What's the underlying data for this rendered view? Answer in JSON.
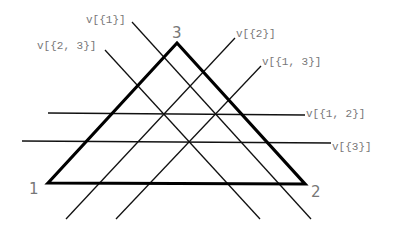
{
  "diagram": {
    "type": "triangle-line-arrangement",
    "colors": {
      "triangle": "#000000",
      "lines": "#111111",
      "labels": "#777777"
    },
    "triangle": {
      "vertices": [
        {
          "id": "1",
          "label": "1"
        },
        {
          "id": "2",
          "label": "2"
        },
        {
          "id": "3",
          "label": "3"
        }
      ]
    },
    "lines": [
      {
        "id": "v1",
        "label": "v[{1}]",
        "direction": "descending-right"
      },
      {
        "id": "v23",
        "label": "v[{2, 3}]",
        "direction": "descending-right"
      },
      {
        "id": "v2",
        "label": "v[{2}]",
        "direction": "ascending-right"
      },
      {
        "id": "v13",
        "label": "v[{1, 3}]",
        "direction": "ascending-right"
      },
      {
        "id": "v12",
        "label": "v[{1, 2}]",
        "direction": "horizontal"
      },
      {
        "id": "v3",
        "label": "v[{3}]",
        "direction": "horizontal"
      }
    ]
  }
}
